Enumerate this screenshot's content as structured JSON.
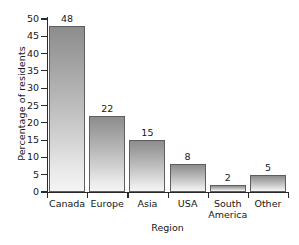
{
  "chart_data": {
    "type": "bar",
    "title": "",
    "xlabel": "Region",
    "ylabel": "Percentage of residents",
    "categories": [
      "Canada",
      "Europe",
      "Asia",
      "USA",
      "South\nAmerica",
      "Other"
    ],
    "values": [
      48,
      22,
      15,
      8,
      2,
      5
    ],
    "value_labels": [
      "48",
      "22",
      "15",
      "8",
      "2",
      "5"
    ],
    "ylim": [
      0,
      50
    ],
    "ytick_labels": [
      "0",
      "5",
      "10",
      "15",
      "20",
      "25",
      "30",
      "35",
      "40",
      "45",
      "50"
    ],
    "ytick_values": [
      0,
      5,
      10,
      15,
      20,
      25,
      30,
      35,
      40,
      45,
      50
    ],
    "grid": false,
    "legend": false,
    "bar_color_top": "#8d8d8d",
    "bar_color_bottom": "#f4f4f4",
    "bar_edge_color": "#5e5e5e",
    "axis_color": "#2a2a2a",
    "background_color": "#ffffff"
  }
}
